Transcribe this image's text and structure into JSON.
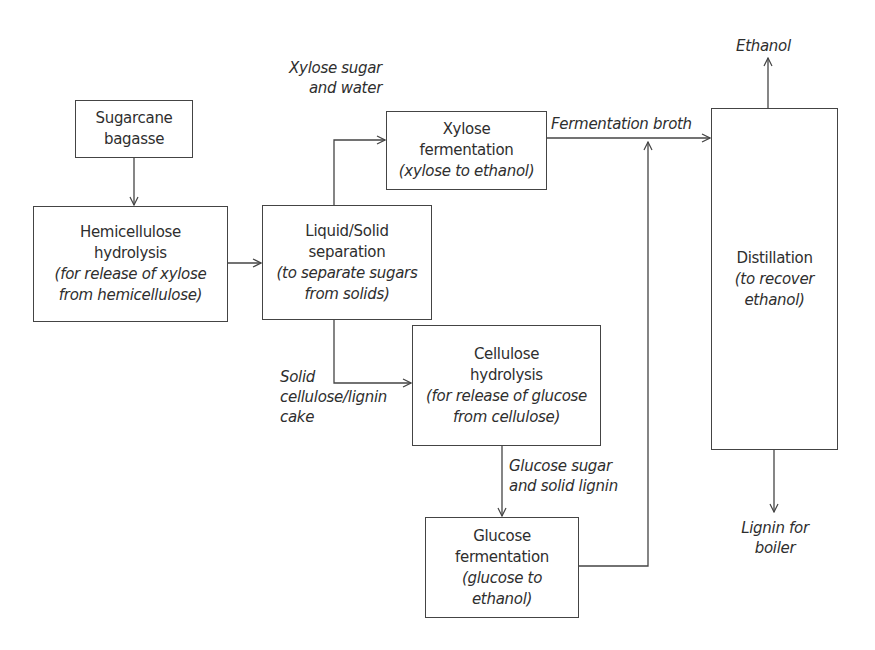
{
  "diagram": {
    "nodes": {
      "sugarcane": {
        "title": [
          "Sugarcane",
          "bagasse"
        ]
      },
      "hemicellulose": {
        "title": [
          "Hemicellulose",
          "hydrolysis"
        ],
        "subtitle": [
          "(for release of xylose",
          "from hemicellulose)"
        ]
      },
      "separation": {
        "title": [
          "Liquid/Solid",
          "separation"
        ],
        "subtitle": [
          "(to separate sugars",
          "from solids)"
        ]
      },
      "xylose_fermentation": {
        "title": [
          "Xylose",
          "fermentation"
        ],
        "subtitle": [
          "(xylose to ethanol)"
        ]
      },
      "cellulose": {
        "title": [
          "Cellulose",
          "hydrolysis"
        ],
        "subtitle": [
          "(for release of glucose",
          "from cellulose)"
        ]
      },
      "glucose_fermentation": {
        "title": [
          "Glucose",
          "fermentation"
        ],
        "subtitle": [
          "(glucose to",
          "ethanol)"
        ]
      },
      "distillation": {
        "title": [
          "Distillation"
        ],
        "subtitle": [
          "(to recover",
          "ethanol)"
        ]
      }
    },
    "edge_labels": {
      "xylose_stream": [
        "Xylose sugar",
        "and water"
      ],
      "solid_stream": [
        "Solid",
        "cellulose/lignin",
        "cake"
      ],
      "broth": [
        "Fermentation broth"
      ],
      "glucose_stream": [
        "Glucose sugar",
        "and solid lignin"
      ],
      "ethanol_out": [
        "Ethanol"
      ],
      "lignin_out": [
        "Lignin for",
        "boiler"
      ]
    },
    "edges": [
      [
        "Sugarcane bagasse",
        "Hemicellulose hydrolysis"
      ],
      [
        "Hemicellulose hydrolysis",
        "Liquid/Solid separation"
      ],
      [
        "Liquid/Solid separation",
        "Xylose fermentation"
      ],
      [
        "Liquid/Solid separation",
        "Cellulose hydrolysis"
      ],
      [
        "Cellulose hydrolysis",
        "Glucose fermentation"
      ],
      [
        "Xylose fermentation",
        "Distillation"
      ],
      [
        "Glucose fermentation",
        "Distillation"
      ],
      [
        "Distillation",
        "Ethanol"
      ],
      [
        "Distillation",
        "Lignin for boiler"
      ]
    ]
  }
}
